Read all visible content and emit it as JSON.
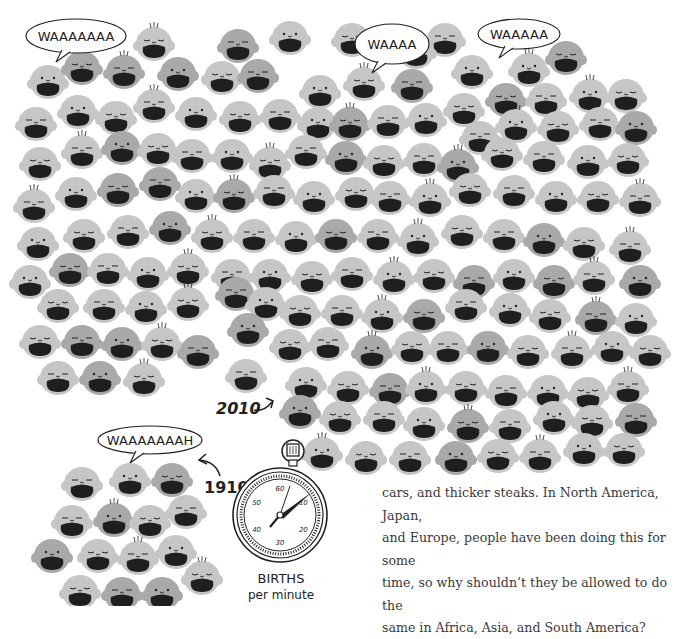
{
  "illustration": {
    "title_2010": "2010",
    "title_1910": "1910",
    "bubbles": [
      {
        "text": "WAAAAAAA",
        "cx": 76,
        "cy": 36,
        "w": 100,
        "h": 34
      },
      {
        "text": "WAAAA",
        "cx": 392,
        "cy": 44,
        "w": 74,
        "h": 40
      },
      {
        "text": "WAAAAA",
        "cx": 519,
        "cy": 34,
        "w": 82,
        "h": 30
      },
      {
        "text": "WAAAAAAAH",
        "cx": 150,
        "cy": 440,
        "w": 104,
        "h": 28
      }
    ],
    "stopwatch": {
      "label_line1": "BIRTHS",
      "label_line2": "per minute",
      "dial_numbers": [
        "60",
        "10",
        "20",
        "30",
        "40",
        "50"
      ]
    },
    "colors": {
      "light": "#c6c6c6",
      "mid": "#a9a9a9",
      "dark": "#8d8d8d",
      "mouth": "#1f1f1f",
      "ink": "#222222"
    },
    "faces_2010": [
      [
        154,
        44,
        "l"
      ],
      [
        238,
        46,
        "m"
      ],
      [
        290,
        38,
        "l"
      ],
      [
        352,
        40,
        "l"
      ],
      [
        445,
        40,
        "l"
      ],
      [
        529,
        70,
        "l"
      ],
      [
        566,
        58,
        "m"
      ],
      [
        416,
        52,
        "l"
      ],
      [
        48,
        82,
        "l"
      ],
      [
        82,
        68,
        "m"
      ],
      [
        124,
        72,
        "m"
      ],
      [
        178,
        74,
        "m"
      ],
      [
        222,
        78,
        "l"
      ],
      [
        258,
        76,
        "m"
      ],
      [
        320,
        92,
        "l"
      ],
      [
        364,
        84,
        "l"
      ],
      [
        412,
        86,
        "m"
      ],
      [
        472,
        72,
        "l"
      ],
      [
        506,
        100,
        "m"
      ],
      [
        546,
        100,
        "l"
      ],
      [
        590,
        96,
        "l"
      ],
      [
        626,
        96,
        "l"
      ],
      [
        36,
        124,
        "l"
      ],
      [
        78,
        112,
        "l"
      ],
      [
        116,
        118,
        "l"
      ],
      [
        154,
        106,
        "l"
      ],
      [
        196,
        114,
        "l"
      ],
      [
        240,
        118,
        "l"
      ],
      [
        280,
        116,
        "l"
      ],
      [
        318,
        124,
        "l"
      ],
      [
        350,
        124,
        "m"
      ],
      [
        388,
        122,
        "l"
      ],
      [
        426,
        120,
        "l"
      ],
      [
        464,
        110,
        "l"
      ],
      [
        480,
        138,
        "l"
      ],
      [
        516,
        126,
        "l"
      ],
      [
        558,
        128,
        "l"
      ],
      [
        600,
        124,
        "l"
      ],
      [
        636,
        128,
        "m"
      ],
      [
        40,
        164,
        "l"
      ],
      [
        82,
        152,
        "l"
      ],
      [
        122,
        148,
        "m"
      ],
      [
        158,
        150,
        "l"
      ],
      [
        192,
        156,
        "l"
      ],
      [
        232,
        156,
        "l"
      ],
      [
        270,
        164,
        "l"
      ],
      [
        306,
        152,
        "l"
      ],
      [
        346,
        158,
        "m"
      ],
      [
        384,
        162,
        "l"
      ],
      [
        424,
        160,
        "l"
      ],
      [
        458,
        166,
        "m"
      ],
      [
        502,
        154,
        "l"
      ],
      [
        544,
        158,
        "l"
      ],
      [
        588,
        162,
        "l"
      ],
      [
        628,
        160,
        "l"
      ],
      [
        34,
        206,
        "l"
      ],
      [
        76,
        194,
        "l"
      ],
      [
        118,
        190,
        "m"
      ],
      [
        160,
        184,
        "m"
      ],
      [
        196,
        196,
        "l"
      ],
      [
        234,
        196,
        "m"
      ],
      [
        274,
        192,
        "l"
      ],
      [
        314,
        198,
        "l"
      ],
      [
        356,
        194,
        "l"
      ],
      [
        390,
        198,
        "l"
      ],
      [
        430,
        200,
        "l"
      ],
      [
        470,
        190,
        "l"
      ],
      [
        514,
        192,
        "l"
      ],
      [
        556,
        198,
        "l"
      ],
      [
        598,
        198,
        "l"
      ],
      [
        640,
        200,
        "l"
      ],
      [
        38,
        244,
        "l"
      ],
      [
        84,
        236,
        "l"
      ],
      [
        128,
        232,
        "l"
      ],
      [
        170,
        228,
        "m"
      ],
      [
        212,
        236,
        "l"
      ],
      [
        254,
        236,
        "l"
      ],
      [
        296,
        238,
        "l"
      ],
      [
        336,
        236,
        "m"
      ],
      [
        378,
        236,
        "l"
      ],
      [
        418,
        240,
        "l"
      ],
      [
        462,
        232,
        "l"
      ],
      [
        504,
        236,
        "l"
      ],
      [
        544,
        240,
        "m"
      ],
      [
        584,
        244,
        "l"
      ],
      [
        630,
        248,
        "l"
      ],
      [
        30,
        282,
        "l"
      ],
      [
        70,
        270,
        "m"
      ],
      [
        108,
        270,
        "l"
      ],
      [
        148,
        274,
        "l"
      ],
      [
        188,
        270,
        "l"
      ],
      [
        232,
        276,
        "l"
      ],
      [
        270,
        276,
        "l"
      ],
      [
        312,
        278,
        "l"
      ],
      [
        352,
        274,
        "l"
      ],
      [
        394,
        278,
        "l"
      ],
      [
        434,
        276,
        "l"
      ],
      [
        474,
        282,
        "m"
      ],
      [
        514,
        276,
        "l"
      ],
      [
        554,
        282,
        "m"
      ],
      [
        594,
        278,
        "l"
      ],
      [
        640,
        282,
        "m"
      ],
      [
        58,
        306,
        "l"
      ],
      [
        104,
        306,
        "l"
      ],
      [
        146,
        308,
        "l"
      ],
      [
        188,
        304,
        "l"
      ],
      [
        236,
        294,
        "m"
      ],
      [
        266,
        304,
        "l"
      ],
      [
        300,
        312,
        "l"
      ],
      [
        342,
        312,
        "l"
      ],
      [
        382,
        316,
        "l"
      ],
      [
        424,
        316,
        "m"
      ],
      [
        466,
        306,
        "l"
      ],
      [
        510,
        310,
        "l"
      ],
      [
        550,
        316,
        "l"
      ],
      [
        596,
        318,
        "m"
      ],
      [
        636,
        320,
        "l"
      ],
      [
        40,
        342,
        "l"
      ],
      [
        82,
        342,
        "m"
      ],
      [
        122,
        344,
        "m"
      ],
      [
        162,
        344,
        "l"
      ],
      [
        198,
        352,
        "m"
      ],
      [
        248,
        330,
        "m"
      ],
      [
        290,
        346,
        "l"
      ],
      [
        328,
        344,
        "l"
      ],
      [
        372,
        352,
        "m"
      ],
      [
        412,
        348,
        "l"
      ],
      [
        448,
        348,
        "l"
      ],
      [
        488,
        348,
        "m"
      ],
      [
        528,
        352,
        "l"
      ],
      [
        572,
        352,
        "l"
      ],
      [
        612,
        348,
        "l"
      ],
      [
        650,
        352,
        "l"
      ],
      [
        58,
        378,
        "l"
      ],
      [
        100,
        378,
        "m"
      ],
      [
        144,
        380,
        "l"
      ],
      [
        246,
        376,
        "l"
      ],
      [
        306,
        384,
        "l"
      ],
      [
        348,
        388,
        "l"
      ],
      [
        390,
        390,
        "m"
      ],
      [
        426,
        388,
        "l"
      ],
      [
        466,
        388,
        "l"
      ],
      [
        506,
        392,
        "l"
      ],
      [
        548,
        392,
        "l"
      ],
      [
        588,
        394,
        "l"
      ],
      [
        628,
        388,
        "l"
      ],
      [
        300,
        412,
        "m"
      ],
      [
        340,
        418,
        "l"
      ],
      [
        384,
        418,
        "l"
      ],
      [
        424,
        424,
        "l"
      ],
      [
        468,
        426,
        "m"
      ],
      [
        510,
        426,
        "l"
      ],
      [
        554,
        418,
        "l"
      ],
      [
        592,
        422,
        "l"
      ],
      [
        636,
        420,
        "m"
      ],
      [
        322,
        454,
        "l"
      ],
      [
        366,
        458,
        "l"
      ],
      [
        410,
        458,
        "l"
      ],
      [
        456,
        458,
        "m"
      ],
      [
        498,
        456,
        "l"
      ],
      [
        540,
        456,
        "l"
      ],
      [
        584,
        450,
        "l"
      ],
      [
        624,
        450,
        "l"
      ]
    ],
    "faces_1910": [
      [
        82,
        484,
        "l"
      ],
      [
        130,
        480,
        "l"
      ],
      [
        172,
        480,
        "m"
      ],
      [
        72,
        522,
        "l"
      ],
      [
        114,
        520,
        "m"
      ],
      [
        150,
        522,
        "l"
      ],
      [
        186,
        512,
        "l"
      ],
      [
        52,
        556,
        "m"
      ],
      [
        98,
        556,
        "l"
      ],
      [
        138,
        558,
        "l"
      ],
      [
        176,
        552,
        "l"
      ],
      [
        80,
        592,
        "l"
      ],
      [
        122,
        594,
        "m"
      ],
      [
        162,
        594,
        "m"
      ],
      [
        202,
        578,
        "l"
      ]
    ]
  },
  "text": {
    "lines": [
      "cars, and thicker steaks. In North America, Japan,",
      "and Europe, people have been doing this for some",
      "time, so why shouldn’t they be allowed to do the",
      "same in Africa, Asia, and South America?"
    ]
  }
}
